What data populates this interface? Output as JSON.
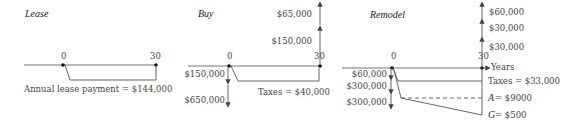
{
  "diagrams": {
    "lease": {
      "title": "Lease",
      "t0": "0",
      "t1": "30",
      "payment_label": "Annual lease payment = $144,000"
    },
    "buy": {
      "title": "Buy",
      "t0": "0",
      "t1": "30",
      "up1": "$65,000",
      "up2": "$150,000",
      "down1": "$150,000",
      "down2": "$650,000",
      "taxes": "Taxes = $40,000"
    },
    "remodel": {
      "title": "Remodel",
      "t0": "0",
      "t1": "30",
      "axis_label": "Years",
      "up1": "$60,000",
      "up2": "$30,000",
      "up3": "$30,000",
      "down1": "$60,000",
      "down2": "$300,000",
      "down3": "$300,000",
      "taxes": "Taxes = $33,000",
      "a_label": "A",
      "a_value": " = $9000",
      "g_label": "G",
      "g_value": " = $500"
    }
  }
}
